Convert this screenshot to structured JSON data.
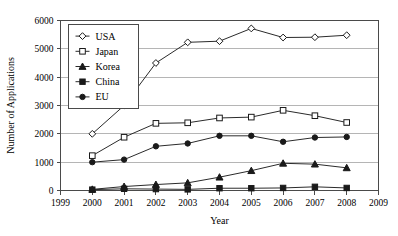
{
  "chart_data": {
    "type": "line",
    "title": "",
    "xlabel": "Year",
    "ylabel": "Number of Applications",
    "x": [
      2000,
      2001,
      2002,
      2003,
      2004,
      2005,
      2006,
      2007,
      2008
    ],
    "xlim": [
      1999,
      2009
    ],
    "ylim": [
      0,
      6000
    ],
    "xticks": [
      "1999",
      "2000",
      "2001",
      "2002",
      "2003",
      "2004",
      "2005",
      "2006",
      "2007",
      "2008",
      "2009"
    ],
    "yticks": [
      "0",
      "1000",
      "2000",
      "3000",
      "4000",
      "5000",
      "6000"
    ],
    "grid": "horizontal",
    "legend_position": "upper-left",
    "series": [
      {
        "name": "USA",
        "marker": "open-diamond",
        "values": [
          2000,
          3000,
          4500,
          5230,
          5270,
          5720,
          5400,
          5410,
          5480
        ]
      },
      {
        "name": "Japan",
        "marker": "open-square",
        "values": [
          1230,
          1880,
          2370,
          2390,
          2560,
          2590,
          2830,
          2640,
          2400
        ]
      },
      {
        "name": "Korea",
        "marker": "filled-triangle",
        "values": [
          40,
          140,
          210,
          270,
          470,
          700,
          960,
          930,
          800
        ]
      },
      {
        "name": "China",
        "marker": "filled-square",
        "values": [
          30,
          60,
          50,
          40,
          80,
          80,
          90,
          130,
          90
        ]
      },
      {
        "name": "EU",
        "marker": "filled-circle",
        "values": [
          1000,
          1090,
          1560,
          1660,
          1930,
          1930,
          1720,
          1870,
          1890
        ]
      }
    ]
  }
}
